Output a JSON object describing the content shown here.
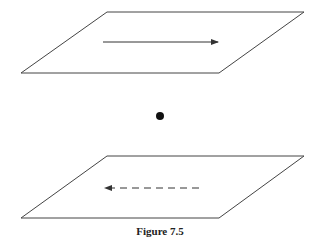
{
  "figure": {
    "caption": "Figure 7.5",
    "stroke_color": "#333333",
    "top_plane": {
      "points": "107,12 304,12 219,73 21,73",
      "arrow": {
        "style": "solid",
        "direction": "right",
        "x1": 103,
        "x2": 218,
        "y": 42
      }
    },
    "center_point": {
      "cx": 160,
      "cy": 116,
      "r": 4
    },
    "bottom_plane": {
      "points": "107,156 304,156 219,218 21,218",
      "arrow": {
        "style": "dashed",
        "direction": "left",
        "x1": 199,
        "x2": 104,
        "y": 188
      }
    }
  }
}
